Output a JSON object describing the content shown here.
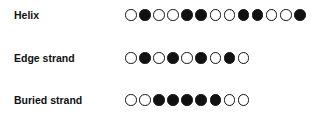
{
  "rows": [
    {
      "label": "Helix",
      "pattern": [
        0,
        1,
        0,
        0,
        1,
        1,
        0,
        0,
        1,
        1,
        0,
        0,
        1
      ]
    },
    {
      "label": "Edge strand",
      "pattern": [
        0,
        1,
        0,
        1,
        0,
        1,
        0,
        1,
        0
      ]
    },
    {
      "label": "Buried strand",
      "pattern": [
        0,
        0,
        1,
        1,
        1,
        1,
        1,
        0,
        0
      ]
    }
  ],
  "legend": {
    "filled": "hydrophobic residue",
    "open": "hydrophilic residue"
  },
  "colors": {
    "filled": "#111111",
    "open": "#ffffff",
    "stroke": "#111111"
  }
}
